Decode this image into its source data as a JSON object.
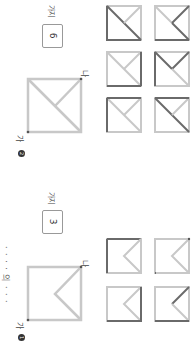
{
  "instruction_partial": "· · · · 의 · · ·",
  "problems": [
    {
      "number": "1",
      "number_glyph": "❶",
      "start_label": "가",
      "end_label": "나",
      "answer": "3",
      "unit": "가지",
      "figure": "square with chevron from top-right and bottom-right corners to center"
    },
    {
      "number": "2",
      "number_glyph": "❷",
      "start_label": "가",
      "end_label": "나",
      "answer": "6",
      "unit": "가지",
      "figure": "square with diagonal from bottom-left to top-right plus half-diagonal to center"
    }
  ],
  "colors": {
    "line_light": "#c8c8c8",
    "line_dark": "#6a6a6a",
    "text": "#444444"
  }
}
